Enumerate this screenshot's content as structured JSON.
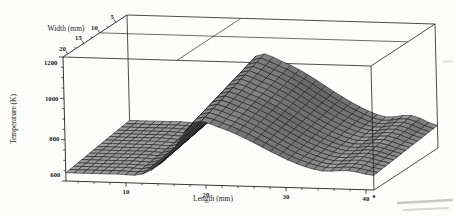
{
  "figure": {
    "background": "#fdfdfc",
    "ink_color": "#1f1f1f",
    "mesh_fill_base": "#9d9d9d",
    "mesh_line_color": "#121212",
    "title": ""
  },
  "chart_data": {
    "type": "surface3d-wireframe",
    "title": "",
    "axes": {
      "length": {
        "label": "Length (mm)",
        "ticks": [
          "10",
          "20",
          "30",
          "40"
        ],
        "range_mm": [
          2.5,
          41
        ],
        "minor_step_mm": 2
      },
      "width": {
        "label": "Width (mm)",
        "ticks": [
          "20",
          "15",
          "10",
          "5"
        ],
        "range_mm_front_to_back": [
          21.5,
          1.5
        ],
        "minor_ticks_mm": [
          17.5,
          12.5,
          7.5
        ]
      },
      "temperature": {
        "label": "Temperature (K)",
        "ticks": [
          "1200",
          "1000",
          "800",
          "600"
        ],
        "range_K": [
          600,
          1200
        ],
        "minor_step_K": 50
      }
    },
    "grid_lines_on_top_face": {
      "width_mm": 10,
      "length_frac": 0.37
    },
    "surface": {
      "lengths_mm": [
        2.5,
        5.7,
        8.9,
        12.1,
        15.3,
        18.5,
        21.8,
        25.0,
        28.2,
        31.4,
        34.6,
        37.8,
        41.0
      ],
      "series": [
        {
          "name": "front edge profile (width ~20 mm)",
          "temperatures_K": [
            640,
            640,
            641,
            645,
            732,
            900,
            882,
            833,
            772,
            717,
            685,
            690,
            670
          ]
        },
        {
          "name": "back edge profile (width ~5 mm)",
          "temperatures_K": [
            690,
            690,
            691,
            696,
            807,
            1020,
            997,
            936,
            858,
            788,
            743,
            754,
            709
          ]
        }
      ],
      "peak": {
        "approx_temperature_K": 1020,
        "approx_length_mm": 19
      },
      "mesh_cells": {
        "along_length": 36,
        "along_width": 16
      }
    },
    "legend": "none",
    "gridlines": "box frame with two grid lines on top face"
  }
}
